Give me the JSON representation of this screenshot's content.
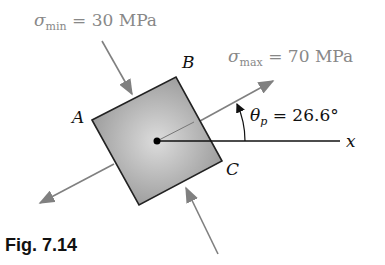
{
  "figure": {
    "caption": "Fig. 7.14",
    "sigma_min": {
      "symbol": "σ",
      "sub": "min",
      "value": "= 30 MPa"
    },
    "sigma_max": {
      "symbol": "σ",
      "sub": "max",
      "value": "= 70 MPa"
    },
    "theta_p": {
      "symbol": "θ",
      "sub": "p",
      "value": "= 26.6°"
    },
    "axis_label": "x",
    "corners": {
      "A": "A",
      "B": "B",
      "C": "C"
    },
    "colors": {
      "element_fill": "#a8a8a8",
      "arrow": "#808080",
      "outline": "#222222"
    }
  }
}
